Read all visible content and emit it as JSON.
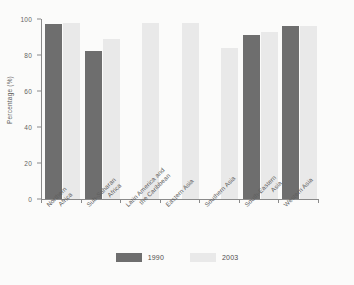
{
  "chart_data": {
    "type": "bar",
    "title": "",
    "subtitle": "",
    "xlabel": "",
    "ylabel": "Percentage (%)",
    "ylim": [
      0,
      100
    ],
    "yticks": [
      0,
      20,
      40,
      60,
      80,
      100
    ],
    "grid": false,
    "legend_position": "bottom",
    "orientation": "vertical",
    "grouping": "grouped",
    "categories": [
      "Northern Africa",
      "Sub-Saharan Africa",
      "Latin America and the Caribbean",
      "Eastern Asia",
      "Southern Asia",
      "South-Eastern Asia",
      "Western Asia"
    ],
    "category_lines": [
      [
        "Northern",
        "Africa"
      ],
      [
        "Sub-Saharan",
        "Africa"
      ],
      [
        "Latin America and",
        "the Caribbean"
      ],
      [
        "Eastern Asia"
      ],
      [
        "Southern Asia"
      ],
      [
        "South-Eastern",
        "Asia"
      ],
      [
        "Western Asia"
      ]
    ],
    "series": [
      {
        "name": "1990",
        "color": "#6e6e6e",
        "values": [
          97,
          82,
          null,
          null,
          null,
          91,
          96
        ]
      },
      {
        "name": "2003",
        "color": "#e9e9e9",
        "values": [
          98,
          89,
          98,
          98,
          84,
          93,
          96
        ]
      }
    ]
  },
  "legend": {
    "items": [
      {
        "label": "1990",
        "color": "#6e6e6e"
      },
      {
        "label": "2003",
        "color": "#e9e9e9"
      }
    ]
  },
  "axes": {
    "y_label": "Percentage (%)",
    "y_tick_labels": [
      "0",
      "20",
      "40",
      "60",
      "80",
      "100"
    ]
  },
  "colors": {
    "series_1990": "#6e6e6e",
    "series_2003": "#e9e9e9",
    "axis": "#8a8a8a",
    "text": "#5b5b5b",
    "background": "#fbfbfa"
  }
}
